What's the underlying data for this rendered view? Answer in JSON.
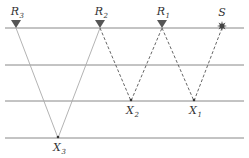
{
  "diagram": {
    "layers_y": [
      28,
      65,
      101,
      138
    ],
    "layer_color": "#888888",
    "receivers": [
      {
        "id": "R3",
        "base": "R",
        "sub": "3",
        "x": 16
      },
      {
        "id": "R2",
        "base": "R",
        "sub": "2",
        "x": 100
      },
      {
        "id": "R1",
        "base": "R",
        "sub": "1",
        "x": 162
      }
    ],
    "source": {
      "id": "S",
      "label": "S",
      "x": 222
    },
    "reflection_points": [
      {
        "id": "X3",
        "base": "X",
        "sub": "3",
        "x": 58,
        "y": 138
      },
      {
        "id": "X2",
        "base": "X",
        "sub": "2",
        "x": 131,
        "y": 101
      },
      {
        "id": "X1",
        "base": "X",
        "sub": "1",
        "x": 194,
        "y": 101
      }
    ],
    "paths": [
      {
        "from": "R3",
        "via": "X3",
        "to": "R2",
        "style": "solid",
        "color": "#aaaaaa"
      },
      {
        "from": "R2",
        "via": "X2",
        "to": "R1",
        "style": "dashed",
        "color": "#555555"
      },
      {
        "from": "R1",
        "via": "X1",
        "to": "S",
        "style": "dashed",
        "color": "#555555"
      }
    ],
    "receiver_color": "#555555",
    "source_color": "#444444"
  }
}
